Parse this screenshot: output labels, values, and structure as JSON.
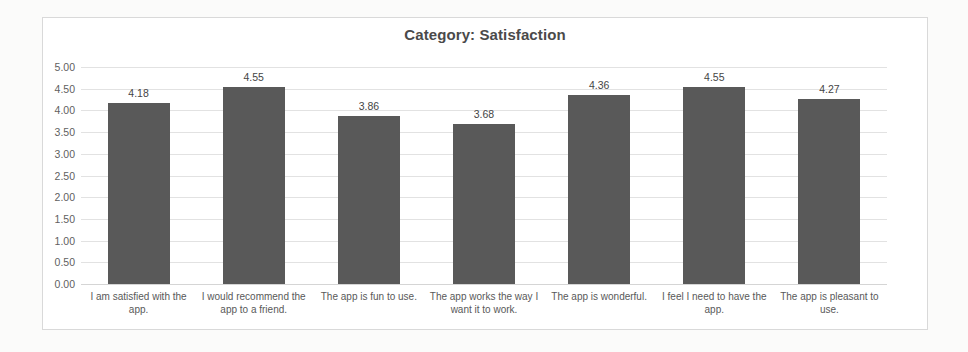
{
  "chart_data": {
    "type": "bar",
    "title": "Category: Satisfaction",
    "xlabel": "",
    "ylabel": "",
    "ylim": [
      0.0,
      5.0
    ],
    "ytick_step": 0.5,
    "grid": true,
    "legend": false,
    "orientation": "vertical",
    "bar_color": "#595959",
    "categories": [
      "I am satisfied with the app.",
      "I would recommend the app to a friend.",
      "The app is fun to use.",
      "The app works the way I want it to work.",
      "The app is wonderful.",
      "I feel I need to have the app.",
      "The app is pleasant to use."
    ],
    "values": [
      4.18,
      4.55,
      3.86,
      3.68,
      4.36,
      4.55,
      4.27
    ],
    "value_labels": [
      "4.18",
      "4.55",
      "3.86",
      "3.68",
      "4.36",
      "4.55",
      "4.27"
    ],
    "ytick_labels": [
      "5.00",
      "4.50",
      "4.00",
      "3.50",
      "3.00",
      "2.50",
      "2.00",
      "1.50",
      "1.00",
      "0.50",
      "0.00"
    ],
    "ytick_values": [
      5.0,
      4.5,
      4.0,
      3.5,
      3.0,
      2.5,
      2.0,
      1.5,
      1.0,
      0.5,
      0.0
    ]
  },
  "colors": {
    "bar": "#595959",
    "gridline": "#e2e2e2",
    "frame_border": "#d9d9d9",
    "title_text": "#4a4a4a",
    "axis_text": "#5f5f5f",
    "label_text": "#595959",
    "background": "#ffffff"
  }
}
